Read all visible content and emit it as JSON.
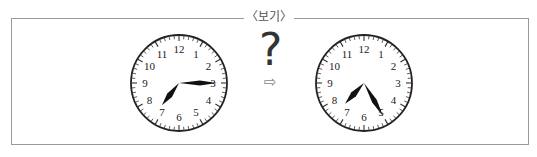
{
  "box": {
    "title": "〈보기〉",
    "border_color": "#9a9a9a"
  },
  "clocks": [
    {
      "id": "left",
      "time": "7:15",
      "hour": 7,
      "minute": 15,
      "numbers": [
        "12",
        "1",
        "2",
        "3",
        "4",
        "5",
        "6",
        "7",
        "8",
        "9",
        "10",
        "11"
      ]
    },
    {
      "id": "right",
      "time": "7:25",
      "hour": 7,
      "minute": 25,
      "numbers": [
        "12",
        "1",
        "2",
        "3",
        "4",
        "5",
        "6",
        "7",
        "8",
        "9",
        "10",
        "11"
      ]
    }
  ],
  "middle": {
    "question_mark": "?",
    "arrow_icon": "⇨"
  }
}
